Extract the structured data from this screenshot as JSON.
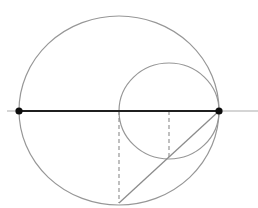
{
  "canvas": {
    "width": 258,
    "height": 208,
    "background": "#ffffff"
  },
  "colors": {
    "thin_gray_stroke": "#979797",
    "dashed_gray_stroke": "#8c8c8c",
    "axis_gray_stroke": "#ababab",
    "dark_diameter_stroke": "#1f1f1f",
    "endpoint_dot_fill": "#0d0d0d"
  },
  "shapes": [
    {
      "id": "axis-line",
      "type": "line",
      "x1": 7,
      "y1": 111,
      "x2": 258,
      "y2": 111,
      "stroke": "#ababab",
      "width": 1
    },
    {
      "id": "large-circle",
      "type": "ellipse",
      "cx": 119,
      "cy": 110.5,
      "rx": 100,
      "ry": 94.5,
      "stroke": "#979797",
      "width": 1.2
    },
    {
      "id": "small-circle",
      "type": "ellipse",
      "cx": 169,
      "cy": 111,
      "rx": 50,
      "ry": 48,
      "stroke": "#979797",
      "width": 1.2
    },
    {
      "id": "dashed-radius-line",
      "type": "line",
      "x1": 119,
      "y1": 111,
      "x2": 119,
      "y2": 203,
      "stroke": "#8c8c8c",
      "width": 1.1,
      "dash": "4 3"
    },
    {
      "id": "dashed-drop-line",
      "type": "line",
      "x1": 169,
      "y1": 111,
      "x2": 169,
      "y2": 157,
      "stroke": "#8c8c8c",
      "width": 1.1,
      "dash": "4 3"
    },
    {
      "id": "chord-line",
      "type": "line",
      "x1": 119,
      "y1": 203,
      "x2": 219,
      "y2": 111,
      "stroke": "#8c8c8c",
      "width": 1.3
    },
    {
      "id": "diameter-line",
      "type": "line",
      "x1": 19,
      "y1": 111,
      "x2": 219,
      "y2": 111,
      "stroke": "#1f1f1f",
      "width": 2
    },
    {
      "id": "left-endpoint-dot",
      "type": "dot",
      "cx": 19,
      "cy": 111,
      "r": 3.6,
      "fill": "#0d0d0d"
    },
    {
      "id": "right-endpoint-dot",
      "type": "dot",
      "cx": 219,
      "cy": 111,
      "r": 3.6,
      "fill": "#0d0d0d"
    }
  ]
}
